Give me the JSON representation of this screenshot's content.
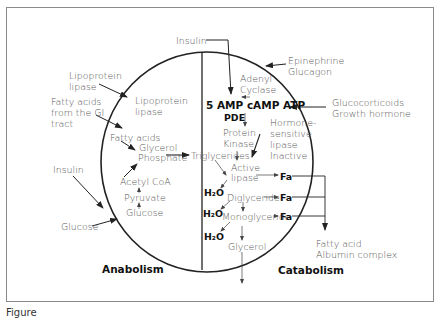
{
  "diagram": {
    "regions": {
      "left": "Anabolism",
      "right": "Catabolism"
    },
    "external_inputs": {
      "insulin_top": "Insulin",
      "epinephrine": "Epinephrine",
      "glucagon": "Glucagon",
      "glucocorticoids": "Glucocorticoids",
      "growth_hormone": "Growth hormone",
      "lipoprotein_lipase_outer_1": "Lipoprotein",
      "lipoprotein_lipase_outer_2": "lipase",
      "fatty_acids_gi_1": "Fatty acids",
      "fatty_acids_gi_2": "from the GI",
      "fatty_acids_gi_3": "tract",
      "insulin_left": "Insulin",
      "glucose_outer": "Glucose"
    },
    "anabolism_nodes": {
      "lipoprotein_lipase_inner_1": "Lipoprotein",
      "lipoprotein_lipase_inner_2": "lipase",
      "fatty_acids": "Fatty acids",
      "glycerol_phosphate_1": "Glycerol",
      "glycerol_phosphate_2": "Phosphate",
      "acetyl_coa": "Acetyl CoA",
      "pyruvate": "Pyruvate",
      "glucose": "Glucose"
    },
    "catabolism_nodes": {
      "adenyl_cyclase_1": "Adenyl",
      "adenyl_cyclase_2": "Cyclase",
      "camp_row": "5 AMP cAMP ATP",
      "pde": "PDE",
      "protein_kinase_1": "Protein",
      "protein_kinase_2": "Kinase",
      "hsl_1": "Hormone-",
      "hsl_2": "sensitive",
      "hsl_3": "lipase",
      "hsl_4": "Inactive",
      "triglycerides": "Triglycerides",
      "active_lipase_1": "Active",
      "active_lipase_2": "lipase",
      "diglyceride": "Diglyceride",
      "monoglyceride": "Monoglyceride",
      "glycerol": "Glycerol",
      "water": "H₂O",
      "fa": "Fa"
    },
    "outputs": {
      "fatty_acid_albumin_1": "Fatty acid",
      "fatty_acid_albumin_2": "Albumin complex"
    }
  },
  "caption": "Figure"
}
